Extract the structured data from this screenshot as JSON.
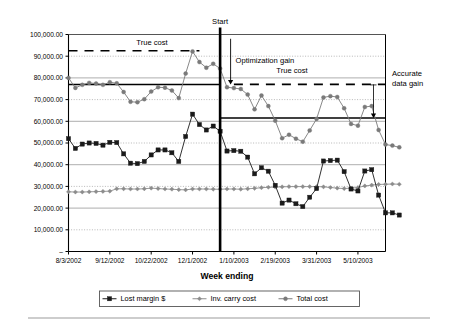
{
  "chart_data": {
    "type": "line",
    "title": "",
    "xlabel": "Week ending",
    "ylabel": "",
    "ylim": [
      0,
      100000
    ],
    "ytick_labels": [
      "100,000.00",
      "90,000.00",
      "80,000.00",
      "70,000.00",
      "60,000.00",
      "50,000.00",
      "40,000.00",
      "30,000.00",
      "20,000.00",
      "10,000.00",
      "–"
    ],
    "ytick_values": [
      100000,
      90000,
      80000,
      70000,
      60000,
      50000,
      40000,
      30000,
      20000,
      10000,
      0
    ],
    "xtick_labels": [
      "8/3/2002",
      "9/12/2002",
      "10/22/2002",
      "12/1/2002",
      "1/10/2003",
      "2/19/2003",
      "3/31/2003",
      "5/10/2003"
    ],
    "xtick_indices": [
      0,
      6,
      12,
      18,
      24,
      30,
      36,
      42
    ],
    "grid": true,
    "legend_position": "bottom",
    "n_points": 46,
    "series": [
      {
        "name": "Lost margin $",
        "color": "#1a1a1a",
        "marker": "square",
        "values": [
          52000,
          47500,
          49500,
          50000,
          49800,
          49000,
          50300,
          50200,
          45000,
          40700,
          40500,
          41500,
          44500,
          46800,
          46800,
          45500,
          41500,
          53000,
          63300,
          58500,
          56000,
          57800,
          55400,
          46300,
          46500,
          46200,
          43500,
          35800,
          38600,
          37000,
          30500,
          22300,
          23700,
          22000,
          20700,
          25000,
          29000,
          41700,
          41900,
          42100,
          36800,
          28800,
          27900,
          37100,
          37700,
          26000,
          17800,
          17800,
          16800
        ]
      },
      {
        "name": "Inv. carry cost",
        "color": "#8c8c8c",
        "marker": "diamond",
        "values": [
          27500,
          27400,
          27400,
          27500,
          27600,
          27700,
          27800,
          28900,
          28900,
          28800,
          28800,
          28900,
          29200,
          29000,
          28800,
          28700,
          28500,
          28400,
          28800,
          28800,
          28800,
          28700,
          28700,
          28800,
          28800,
          28700,
          28900,
          29100,
          29400,
          29600,
          29700,
          29800,
          29900,
          29900,
          29900,
          29900,
          29900,
          29800,
          29500,
          29200,
          29000,
          29200,
          29500,
          30200,
          30600,
          30900,
          31000,
          31100,
          31000
        ]
      },
      {
        "name": "Total cost",
        "color": "#7a7a7a",
        "marker": "circle",
        "values": [
          80000,
          75400,
          76800,
          77700,
          77400,
          76800,
          78000,
          77500,
          73500,
          69000,
          68800,
          70200,
          73700,
          75700,
          75500,
          74200,
          70700,
          82000,
          92200,
          87300,
          84700,
          86500,
          84300,
          75700,
          75300,
          74900,
          72300,
          65500,
          71900,
          67000,
          60300,
          52200,
          53800,
          52000,
          50600,
          55800,
          61100,
          71000,
          71600,
          71200,
          66000,
          58800,
          58000,
          66600,
          67000,
          56000,
          49300,
          48800,
          48000
        ]
      }
    ],
    "reference_lines": [
      {
        "name": "true-cost-dashed-before",
        "value": 92500,
        "style": "dashed",
        "x_from_index": 0,
        "x_to_index": 19,
        "label": "True cost"
      },
      {
        "name": "true-cost-dashed-after",
        "value": 77000,
        "style": "dashed",
        "x_from_index": 24,
        "x_to_index": 48,
        "label": "True cost"
      },
      {
        "name": "avg-total-solid-before",
        "value": 77000,
        "style": "solid",
        "x_from_index": 0,
        "x_to_index": 22,
        "label": ""
      },
      {
        "name": "avg-total-solid-after",
        "value": 61500,
        "style": "solid",
        "x_from_index": 22,
        "x_to_index": 48,
        "label": ""
      }
    ],
    "markers": {
      "start_line": {
        "label": "Start",
        "x_index": 22
      },
      "optimization_gain": {
        "label": "Optimization gain",
        "from_value": 92500,
        "to_value": 77000
      },
      "accurate_data_gain": {
        "label_line1": "Accurate",
        "label_line2": "data gain",
        "from_value": 77000,
        "to_value": 61500
      }
    },
    "annotations": [
      {
        "name": "true-cost-left",
        "text": "True cost"
      },
      {
        "name": "optimization-gain",
        "text": "Optimization gain"
      },
      {
        "name": "true-cost-right",
        "text": "True cost"
      },
      {
        "name": "accurate-data-gain-line1",
        "text": "Accurate"
      },
      {
        "name": "accurate-data-gain-line2",
        "text": "data gain"
      },
      {
        "name": "start",
        "text": "Start"
      }
    ]
  },
  "legend": {
    "items": [
      {
        "label": "Lost margin $",
        "marker": "square",
        "color": "#1a1a1a"
      },
      {
        "label": "Inv. carry cost",
        "marker": "diamond",
        "color": "#8c8c8c"
      },
      {
        "label": "Total cost",
        "marker": "circle",
        "color": "#7a7a7a"
      }
    ]
  },
  "axis": {
    "x_title": "Week ending"
  },
  "colors": {
    "plot_border": "#000000",
    "gridline": "#999999",
    "background": "#ffffff",
    "footer_rule": "#bdbdbd"
  }
}
